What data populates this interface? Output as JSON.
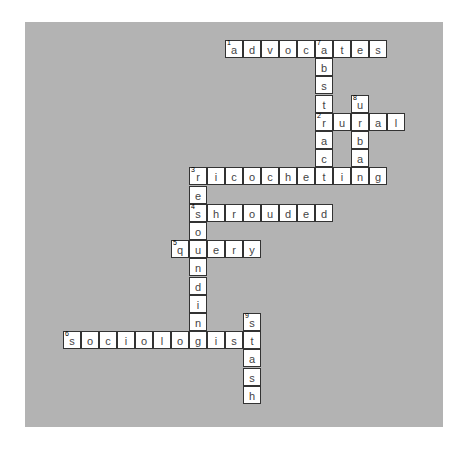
{
  "puzzle": {
    "type": "crossword",
    "grid": {
      "origin_x": 38,
      "origin_y": 18,
      "cell_step_x": 18.0,
      "cell_step_y": 18.2
    },
    "colors": {
      "panel": "#b3b3b3",
      "cell": "#ffffff",
      "border": "#333333",
      "letter": "#444444"
    },
    "words": [
      {
        "number": 1,
        "direction": "across",
        "answer": "advocates",
        "row": 0,
        "col": 9
      },
      {
        "number": 7,
        "direction": "down",
        "answer": "abstract",
        "row": 0,
        "col": 14
      },
      {
        "number": 8,
        "direction": "down",
        "answer": "urban",
        "row": 3,
        "col": 16
      },
      {
        "number": 2,
        "direction": "across",
        "answer": "rural",
        "row": 4,
        "col": 14
      },
      {
        "number": 3,
        "direction": "across",
        "answer": "ricocheting",
        "row": 7,
        "col": 7
      },
      {
        "number": 3,
        "direction": "down",
        "answer": "resounding",
        "row": 7,
        "col": 7
      },
      {
        "number": 4,
        "direction": "across",
        "answer": "shrouded",
        "row": 9,
        "col": 7
      },
      {
        "number": 5,
        "direction": "across",
        "answer": "query",
        "row": 11,
        "col": 6
      },
      {
        "number": 6,
        "direction": "across",
        "answer": "sociologist",
        "row": 16,
        "col": 0
      },
      {
        "number": 9,
        "direction": "down",
        "answer": "stash",
        "row": 15,
        "col": 10
      }
    ]
  }
}
